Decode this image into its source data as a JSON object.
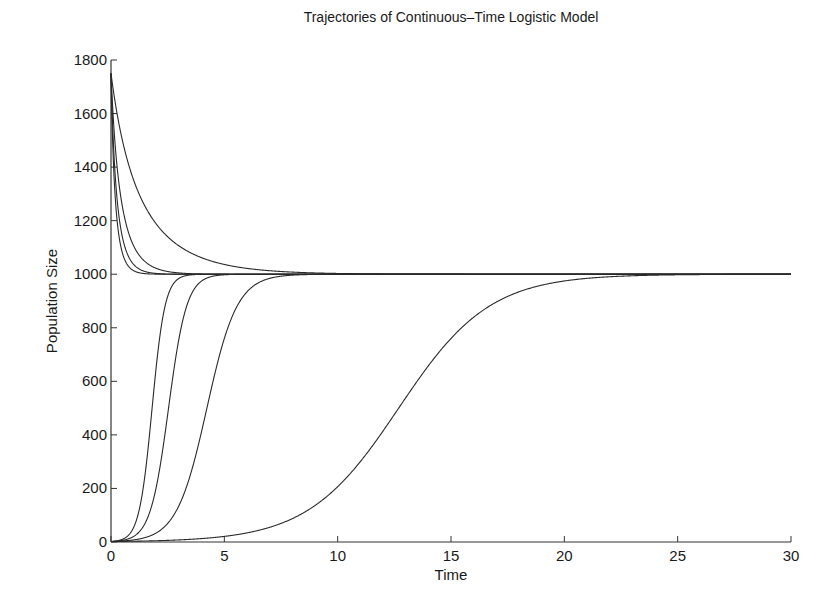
{
  "chart_data": {
    "type": "line",
    "title": "Trajectories of Continuous–Time Logistic Model",
    "xlabel": "Time",
    "ylabel": "Population Size",
    "xlim": [
      0,
      30
    ],
    "ylim": [
      0,
      1800
    ],
    "xticks": [
      0,
      5,
      10,
      15,
      20,
      25,
      30
    ],
    "yticks": [
      0,
      200,
      400,
      600,
      800,
      1000,
      1200,
      1400,
      1600,
      1800
    ],
    "grid": false,
    "legend": null,
    "model": {
      "equation": "N(t) = K / (1 + ((K - N0)/N0) * exp(-r t))",
      "K": 1000
    },
    "series": [
      {
        "name": "N0=1.75, r=0.5",
        "N0": 1.75,
        "r": 0.5
      },
      {
        "name": "N0=1.75, r=1.5",
        "N0": 1.75,
        "r": 1.5
      },
      {
        "name": "N0=1.75, r=2.5",
        "N0": 1.75,
        "r": 2.5
      },
      {
        "name": "N0=1.75, r=3.5",
        "N0": 1.75,
        "r": 3.5
      },
      {
        "name": "N0=1750, r=0.5",
        "N0": 1750,
        "r": 0.5
      },
      {
        "name": "N0=1750, r=1.5",
        "N0": 1750,
        "r": 1.5
      },
      {
        "name": "N0=1750, r=2.5",
        "N0": 1750,
        "r": 2.5
      },
      {
        "name": "N0=1750, r=3.5",
        "N0": 1750,
        "r": 3.5
      }
    ],
    "sampled": {
      "x": [
        0,
        1,
        2,
        3,
        4,
        5,
        6,
        8,
        10,
        12,
        14,
        16,
        18,
        20,
        25,
        30
      ],
      "series": [
        {
          "name": "N0=1.75, r=0.5",
          "values": [
            2,
            3,
            5,
            8,
            13,
            21,
            34,
            87,
            207,
            414,
            658,
            839,
            934,
            975,
            998,
            1000
          ]
        },
        {
          "name": "N0=1.75, r=1.5",
          "values": [
            2,
            8,
            35,
            141,
            458,
            815,
            952,
            998,
            1000,
            1000,
            1000,
            1000,
            1000,
            1000,
            1000,
            1000
          ]
        },
        {
          "name": "N0=1.75, r=2.5",
          "values": [
            2,
            21,
            251,
            938,
            997,
            1000,
            1000,
            1000,
            1000,
            1000,
            1000,
            1000,
            1000,
            1000,
            1000,
            1000
          ]
        },
        {
          "name": "N0=1.75, r=3.5",
          "values": [
            2,
            56,
            667,
            997,
            1000,
            1000,
            1000,
            1000,
            1000,
            1000,
            1000,
            1000,
            1000,
            1000,
            1000,
            1000
          ]
        },
        {
          "name": "N0=1750, r=0.5",
          "values": [
            1750,
            1350,
            1188,
            1105,
            1061,
            1036,
            1021,
            1008,
            1003,
            1001,
            1000,
            1000,
            1000,
            1000,
            1000,
            1000
          ]
        },
        {
          "name": "N0=1750, r=1.5",
          "values": [
            1750,
            1105,
            1021,
            1005,
            1001,
            1000,
            1000,
            1000,
            1000,
            1000,
            1000,
            1000,
            1000,
            1000,
            1000,
            1000
          ]
        },
        {
          "name": "N0=1750, r=2.5",
          "values": [
            1750,
            1036,
            1003,
            1000,
            1000,
            1000,
            1000,
            1000,
            1000,
            1000,
            1000,
            1000,
            1000,
            1000,
            1000,
            1000
          ]
        },
        {
          "name": "N0=1750, r=3.5",
          "values": [
            1750,
            1013,
            1000,
            1000,
            1000,
            1000,
            1000,
            1000,
            1000,
            1000,
            1000,
            1000,
            1000,
            1000,
            1000,
            1000
          ]
        }
      ]
    }
  },
  "layout": {
    "origin_px": [
      111,
      542
    ],
    "x_end_px": 791,
    "y_top_px": 60
  }
}
